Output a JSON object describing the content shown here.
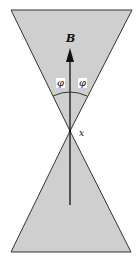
{
  "diagram": {
    "type": "double-cone",
    "colors": {
      "fill": "#cfcfcf",
      "stroke": "#333333",
      "background": "#ffffff"
    },
    "labels": {
      "vector": "B",
      "angle_left": "φ",
      "angle_right": "φ",
      "apex": "x"
    }
  }
}
